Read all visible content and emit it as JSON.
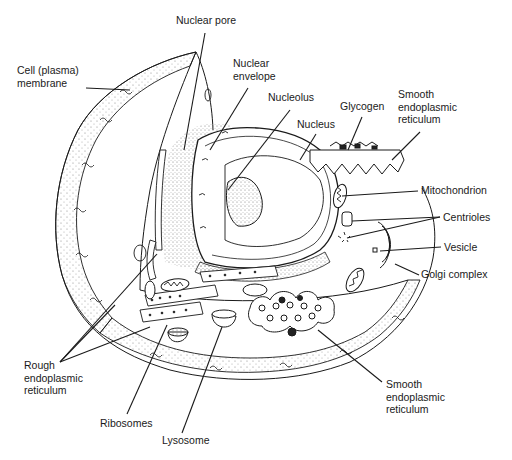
{
  "diagram": {
    "labels": [
      {
        "id": "nuclear-pore",
        "text": "Nuclear pore",
        "x": 176,
        "y": 20
      },
      {
        "id": "cell-membrane",
        "text": "Cell (plasma)\nmembrane",
        "x": 17,
        "y": 70
      },
      {
        "id": "nuclear-envelope",
        "text": "Nuclear\nenvelope",
        "x": 233,
        "y": 63
      },
      {
        "id": "nucleolus",
        "text": "Nucleolus",
        "x": 268,
        "y": 97
      },
      {
        "id": "glycogen",
        "text": "Glycogen",
        "x": 340,
        "y": 105
      },
      {
        "id": "smooth-er-top",
        "text": "Smooth\nendoplasmic\nreticulum",
        "x": 398,
        "y": 94
      },
      {
        "id": "nucleus",
        "text": "Nucleus",
        "x": 297,
        "y": 122
      },
      {
        "id": "mitochondrion",
        "text": "Mitochondrion",
        "x": 421,
        "y": 185
      },
      {
        "id": "centrioles",
        "text": "Centrioles",
        "x": 443,
        "y": 211
      },
      {
        "id": "vesicle",
        "text": "Vesicle",
        "x": 444,
        "y": 241
      },
      {
        "id": "golgi-complex",
        "text": "Golgi complex",
        "x": 421,
        "y": 268
      },
      {
        "id": "rough-er",
        "text": "Rough\nendoplasmic\nreticulum",
        "x": 24,
        "y": 359
      },
      {
        "id": "smooth-er-bottom",
        "text": "Smooth\nendoplasmic\nreticulum",
        "x": 386,
        "y": 378
      },
      {
        "id": "ribosomes",
        "text": "Ribosomes",
        "x": 100,
        "y": 417
      },
      {
        "id": "lysosome",
        "text": "Lysosome",
        "x": 162,
        "y": 434
      }
    ],
    "leader_lines": [
      {
        "label": "nuclear-pore",
        "x1": 205,
        "y1": 33,
        "x2": 184,
        "y2": 150
      },
      {
        "label": "cell-membrane",
        "x1": 86,
        "y1": 88,
        "x2": 130,
        "y2": 90
      },
      {
        "label": "nuclear-envelope",
        "x1": 248,
        "y1": 88,
        "x2": 210,
        "y2": 150
      },
      {
        "label": "nucleolus",
        "x1": 290,
        "y1": 110,
        "x2": 228,
        "y2": 190
      },
      {
        "label": "glycogen",
        "x1": 362,
        "y1": 117,
        "x2": 348,
        "y2": 150
      },
      {
        "label": "smooth-er-top",
        "x1": 420,
        "y1": 132,
        "x2": 392,
        "y2": 160
      },
      {
        "label": "nucleus",
        "x1": 316,
        "y1": 134,
        "x2": 300,
        "y2": 160
      },
      {
        "label": "mitochondrion",
        "x1": 418,
        "y1": 191,
        "x2": 342,
        "y2": 196
      },
      {
        "label": "centrioles-a",
        "x1": 440,
        "y1": 217,
        "x2": 352,
        "y2": 221
      },
      {
        "label": "centrioles-b",
        "x1": 440,
        "y1": 217,
        "x2": 347,
        "y2": 238
      },
      {
        "label": "vesicle",
        "x1": 441,
        "y1": 247,
        "x2": 380,
        "y2": 251
      },
      {
        "label": "golgi-complex",
        "x1": 419,
        "y1": 275,
        "x2": 395,
        "y2": 264
      },
      {
        "label": "rough-er-a",
        "x1": 60,
        "y1": 362,
        "x2": 157,
        "y2": 254
      },
      {
        "label": "rough-er-b",
        "x1": 60,
        "y1": 362,
        "x2": 115,
        "y2": 305
      },
      {
        "label": "rough-er-c",
        "x1": 60,
        "y1": 362,
        "x2": 150,
        "y2": 327
      },
      {
        "label": "smooth-er-bottom",
        "x1": 382,
        "y1": 382,
        "x2": 318,
        "y2": 330
      },
      {
        "label": "ribosomes",
        "x1": 127,
        "y1": 414,
        "x2": 167,
        "y2": 325
      },
      {
        "label": "lysosome",
        "x1": 182,
        "y1": 433,
        "x2": 222,
        "y2": 327
      }
    ],
    "colors": {
      "line": "#1a1a1a",
      "stipple": "#9a9a9a",
      "fill_dark": "#222222",
      "background": "#ffffff"
    }
  }
}
